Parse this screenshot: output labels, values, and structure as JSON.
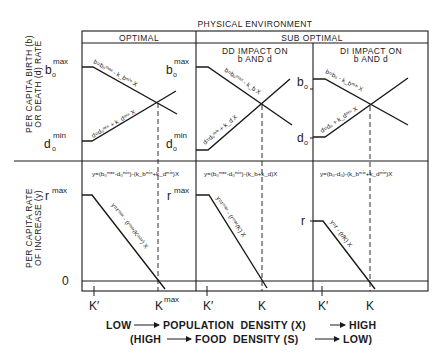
{
  "title": "PHYSICAL ENVIRONMENT",
  "columns": {
    "optimal": {
      "label": "OPTIMAL"
    },
    "sub_optimal": {
      "label": "SUB OPTIMAL",
      "dd": {
        "line1": "DD IMPACT ON",
        "line2": "b AND d"
      },
      "di": {
        "line1": "DI IMPACT ON",
        "line2": "b AND d"
      }
    }
  },
  "y_axis_top": {
    "line1": "PER CAPITA BIRTH (b)",
    "line2": "OR DEATH (d) RATE",
    "ticks": [
      {
        "base": "b",
        "sub": "o",
        "sup": "max"
      },
      {
        "base": "d",
        "sub": "o",
        "sup": "min"
      }
    ]
  },
  "y_axis_bottom": {
    "line1": "PER CAPITA RATE",
    "line2": "OF INCREASE (y)",
    "ticks": [
      {
        "base": "r",
        "sup": "max"
      },
      {
        "base": "0"
      }
    ]
  },
  "panels": {
    "optimal_top": {
      "b_eq": "b=b₀ᵐᵃˣ - k_bᵐⁱⁿ X",
      "d_eq": "d=d₀ᵐⁱⁿ + k_dᵐⁱⁿ X",
      "right_b": {
        "base": "b",
        "sub": "o",
        "sup": "max"
      },
      "right_d": {
        "base": "d",
        "sub": "o",
        "sup": "min"
      }
    },
    "dd_top": {
      "b_eq": "b=b₀ᵐᵃˣ - k_b X",
      "d_eq": "d=d₀ᵐⁱⁿ + k_d X",
      "right_b": {
        "base": "b",
        "sub": "o"
      },
      "right_d": {
        "base": "d",
        "sub": "o"
      }
    },
    "di_top": {
      "b_eq": "b=b₀ - k_bᵐⁱⁿ X",
      "d_eq": "d=d₀ + k_dᵐⁱⁿ X"
    },
    "optimal_bottom": {
      "y_eq": "y=(b₀ᵐᵃˣ-d₀ᵐⁱⁿ)-(k_bᵐⁱⁿ+k_dᵐⁱⁿ)X",
      "line_eq": "y=rᵐᵃˣ - (rᵐᵃˣ/Kᵐᵃˣ) X",
      "right_r": {
        "base": "r",
        "sup": "max"
      }
    },
    "dd_bottom": {
      "y_eq": "y=(b₀ᵐᵃˣ-d₀ᵐⁱⁿ)-(k_b+k_d)X",
      "line_eq": "y=rᵐᵃˣ - (rᵐᵃˣ/K) X",
      "right_r": {
        "base": "r"
      }
    },
    "di_bottom": {
      "y_eq": "y=(b₀-d₀)-(k_bᵐⁱⁿ+k_dᵐⁱⁿ)X",
      "line_eq": "y=r - (r/K) X"
    }
  },
  "x_ticks": [
    {
      "label": "K′"
    },
    {
      "label": "K",
      "sup": "max"
    },
    {
      "label": "K′"
    },
    {
      "label": "K"
    },
    {
      "label": "K′"
    },
    {
      "label": "K"
    }
  ],
  "x_axis": {
    "line1_left": "LOW",
    "line1_mid": "POPULATION  DENSITY (X)",
    "line1_right": "HIGH",
    "line2_left": "(HIGH",
    "line2_mid": "FOOD  DENSITY (S)",
    "line2_right": "LOW)"
  },
  "colors": {
    "ink": "#1a1a1a",
    "background": "#ffffff"
  }
}
